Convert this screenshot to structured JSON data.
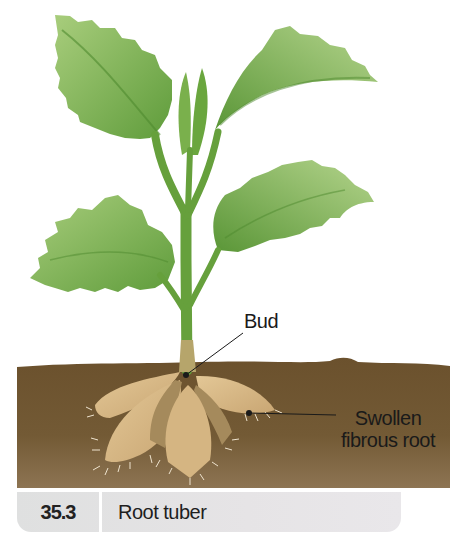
{
  "figure": {
    "number": "35.3",
    "title": "Root tuber"
  },
  "labels": {
    "bud": "Bud",
    "swollen_line1": "Swollen",
    "swollen_line2": "fibrous root"
  },
  "colors": {
    "leaf_dark": "#5e9a3a",
    "leaf_light": "#a9cc7d",
    "stem": "#6aa03f",
    "soil": "#6e5430",
    "soil_light": "#8a6b41",
    "tuber": "#d8b985",
    "tuber_shadow": "#a58a5c",
    "caption_bg": "#e3e2e3"
  }
}
